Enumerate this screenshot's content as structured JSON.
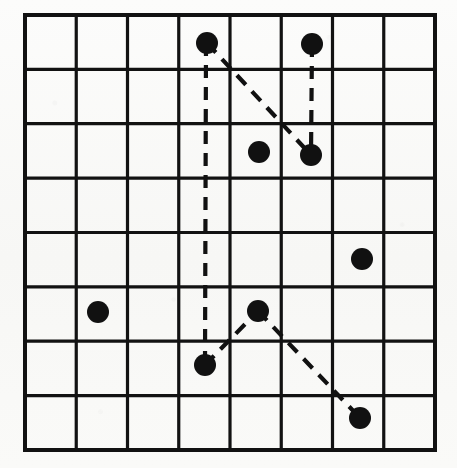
{
  "figure": {
    "background_color": "#fbfbfa",
    "ink_color": "#111111",
    "type": "8x8 square grid diagram"
  },
  "grid": {
    "columns": 8,
    "rows": 8,
    "x_left": 25,
    "y_top": 15,
    "x_right": 435,
    "y_bottom": 450,
    "cell_width": 51.25,
    "cell_height": 54.375,
    "outer_stroke_width": 4,
    "inner_stroke_width": 3.2,
    "stroke_color": "#121212",
    "x_lines": [
      25,
      76.25,
      127.5,
      178.75,
      230,
      281.25,
      332.5,
      383.75,
      435
    ],
    "y_lines": [
      15,
      69.4,
      123.7,
      178.1,
      232.5,
      286.9,
      341.2,
      395.6,
      450
    ]
  },
  "chart_data": {
    "type": "scatter",
    "xlabel": "",
    "ylabel": "",
    "xlim": [
      0,
      8
    ],
    "ylim": [
      0,
      8
    ],
    "grid": true,
    "legend": "none",
    "dot_radius_px": 11,
    "dot_color": "#111111",
    "points": [
      {
        "id": "p1",
        "label": "top-left-node",
        "px": 207,
        "py": 43,
        "col": 4,
        "row": 1
      },
      {
        "id": "p2",
        "label": "top-right-node",
        "px": 312,
        "py": 44,
        "col": 6,
        "row": 1
      },
      {
        "id": "p3",
        "label": "mid-center-node",
        "px": 259,
        "py": 152,
        "col": 5,
        "row": 3
      },
      {
        "id": "p4",
        "label": "mid-right-node",
        "px": 311,
        "py": 155,
        "col": 6,
        "row": 3
      },
      {
        "id": "p5",
        "label": "right-node",
        "px": 362,
        "py": 259,
        "col": 7,
        "row": 5
      },
      {
        "id": "p6",
        "label": "left-node",
        "px": 98,
        "py": 312,
        "col": 2,
        "row": 6
      },
      {
        "id": "p7",
        "label": "lower-center-node",
        "px": 258,
        "py": 311,
        "col": 5,
        "row": 6
      },
      {
        "id": "p8",
        "label": "lower-left-node",
        "px": 205,
        "py": 365,
        "col": 4,
        "row": 7
      },
      {
        "id": "p9",
        "label": "bottom-right-node",
        "px": 360,
        "py": 418,
        "col": 7,
        "row": 8
      }
    ],
    "edges": [
      {
        "id": "e1",
        "label": "vertical-long-edge",
        "from": "p1",
        "to": "p8",
        "x1": 206,
        "y1": 43,
        "x2": 205,
        "y2": 365,
        "style": "dashed"
      },
      {
        "id": "e2",
        "label": "diagonal-upper-edge",
        "from": "p1",
        "to": "p4",
        "x1": 207,
        "y1": 43,
        "x2": 311,
        "y2": 155,
        "style": "dashed"
      },
      {
        "id": "e3",
        "label": "vertical-short-edge",
        "from": "p2",
        "to": "p4",
        "x1": 312,
        "y1": 44,
        "x2": 311,
        "y2": 155,
        "style": "dashed"
      },
      {
        "id": "e4",
        "label": "diagonal-lower-left-edge",
        "from": "p8",
        "to": "p7",
        "x1": 205,
        "y1": 365,
        "x2": 258,
        "y2": 311,
        "style": "dashed"
      },
      {
        "id": "e5",
        "label": "diagonal-lower-right-edge",
        "from": "p7",
        "to": "p9",
        "x1": 258,
        "y1": 311,
        "x2": 360,
        "y2": 418,
        "style": "dashed"
      }
    ],
    "dash_pattern": "13 9"
  }
}
